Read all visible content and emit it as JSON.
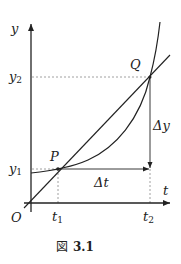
{
  "figure": {
    "caption_prefix": "図",
    "caption_number": "3.1",
    "axes": {
      "x_label": "t",
      "y_label": "y",
      "origin_label": "O"
    },
    "points": {
      "P": {
        "label": "P"
      },
      "Q": {
        "label": "Q"
      }
    },
    "ticks": {
      "t1": {
        "base": "t",
        "sub": "1"
      },
      "t2": {
        "base": "t",
        "sub": "2"
      },
      "y1": {
        "base": "y",
        "sub": "1"
      },
      "y2": {
        "base": "y",
        "sub": "2"
      }
    },
    "deltas": {
      "delta_t": "Δt",
      "delta_y": "Δy"
    },
    "colors": {
      "ink": "#222222",
      "guide": "#888888"
    }
  }
}
